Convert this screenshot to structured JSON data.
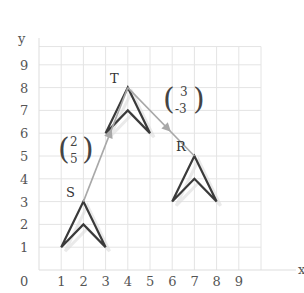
{
  "diagram": {
    "type": "translation-on-grid",
    "axes": {
      "x_label": "x",
      "y_label": "y",
      "origin_label": "0",
      "x_ticks": [
        "1",
        "2",
        "3",
        "4",
        "5",
        "6",
        "7",
        "8",
        "9"
      ],
      "y_ticks": [
        "1",
        "2",
        "3",
        "4",
        "5",
        "6",
        "7",
        "8",
        "9"
      ],
      "x_range": [
        0,
        10
      ],
      "y_range": [
        0,
        9.8
      ]
    },
    "colors": {
      "grid": "#e4e4e4",
      "axis": "#d8d8d8",
      "shape": "#3a3a3a",
      "arrow": "#a8a8a8",
      "shadow": "#dcdcdc",
      "text": "#555555"
    },
    "shapes": [
      {
        "name": "S",
        "label": "S",
        "apex": [
          2,
          3
        ],
        "left": [
          1,
          1
        ],
        "right": [
          3,
          1
        ],
        "inner": [
          2,
          2
        ]
      },
      {
        "name": "T",
        "label": "T",
        "apex": [
          4,
          8
        ],
        "left": [
          3,
          6
        ],
        "right": [
          5,
          6
        ],
        "inner": [
          4,
          7
        ]
      },
      {
        "name": "R",
        "label": "R",
        "apex": [
          7,
          5
        ],
        "left": [
          6,
          3
        ],
        "right": [
          8,
          3
        ],
        "inner": [
          7,
          4
        ]
      }
    ],
    "vectors": [
      {
        "from": "S",
        "to": "T",
        "top": "2",
        "bottom": "5"
      },
      {
        "from": "T",
        "to": "R",
        "top": "3",
        "bottom": "-3"
      }
    ]
  }
}
